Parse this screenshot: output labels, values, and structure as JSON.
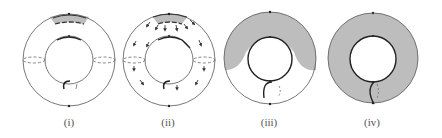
{
  "figure": {
    "panels": [
      {
        "id": "i",
        "label": "(i)",
        "cx": 69,
        "cy": 60,
        "label_x": 69
      },
      {
        "id": "ii",
        "label": "(ii)",
        "cx": 169,
        "cy": 60,
        "label_x": 168
      },
      {
        "id": "iii",
        "label": "(iii)",
        "cx": 270,
        "cy": 58,
        "label_x": 269
      },
      {
        "id": "iv",
        "label": "(iv)",
        "cx": 373,
        "cy": 58,
        "label_x": 372
      }
    ],
    "geometry": {
      "outer_radius": 46,
      "inner_radius": 24
    },
    "colors": {
      "stroke": "#333333",
      "fill_shade": "#bdbdbd",
      "background": "#ffffff"
    }
  }
}
